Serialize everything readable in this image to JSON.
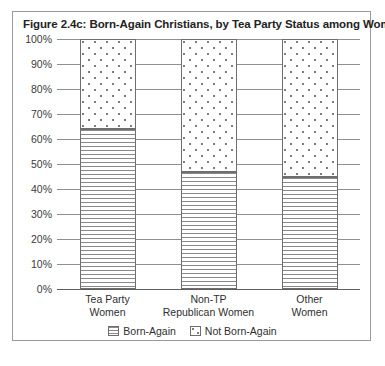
{
  "figure": {
    "title": "Figure 2.4c: Born-Again Christians, by Tea Party Status among Women"
  },
  "chart_data": {
    "type": "bar",
    "stacked": true,
    "normalized_percent": true,
    "title": "Figure 2.4c: Born-Again Christians, by Tea Party Status among Women",
    "xlabel": "",
    "ylabel": "",
    "ylim": [
      0,
      100
    ],
    "yticks": [
      0,
      10,
      20,
      30,
      40,
      50,
      60,
      70,
      80,
      90,
      100
    ],
    "ytick_labels": [
      "0%",
      "10%",
      "20%",
      "30%",
      "40%",
      "50%",
      "60%",
      "70%",
      "80%",
      "90%",
      "100%"
    ],
    "grid": true,
    "legend_position": "bottom-center",
    "categories": [
      {
        "line1": "Tea Party",
        "line2": "Women"
      },
      {
        "line1": "Non-TP",
        "line2": "Republican Women"
      },
      {
        "line1": "Other",
        "line2": "Women"
      }
    ],
    "category_labels": [
      "Tea Party Women",
      "Non-TP Republican Women",
      "Other Women"
    ],
    "series": [
      {
        "name": "Born-Again",
        "pattern": "horizontal-lines",
        "color": "#8a8a8a",
        "values": [
          64,
          47,
          45
        ]
      },
      {
        "name": "Not Born-Again",
        "pattern": "dots",
        "color": "#7d7d7d",
        "values": [
          36,
          53,
          55
        ]
      }
    ]
  },
  "legend": {
    "items": [
      {
        "label": "Born-Again"
      },
      {
        "label": "Not Born-Again"
      }
    ]
  }
}
